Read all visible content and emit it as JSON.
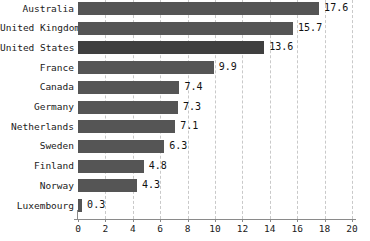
{
  "chart_data": {
    "type": "bar",
    "orientation": "horizontal",
    "title": "",
    "subtitle": "",
    "xlabel": "",
    "ylabel": "",
    "xlim": [
      0,
      20
    ],
    "xticks": [
      0,
      2,
      4,
      6,
      8,
      10,
      12,
      14,
      16,
      18,
      20
    ],
    "xtick_labels": [
      "0",
      "2",
      "4",
      "6",
      "8",
      "10",
      "12",
      "14",
      "16",
      "18",
      "20"
    ],
    "grid": "vertical-dashed",
    "legend": "none",
    "categories": [
      "Australia",
      "United Kingdom",
      "United States",
      "France",
      "Canada",
      "Germany",
      "Netherlands",
      "Sweden",
      "Finland",
      "Norway",
      "Luxembourg"
    ],
    "values": [
      17.6,
      15.7,
      13.6,
      9.9,
      7.4,
      7.3,
      7.1,
      6.3,
      4.8,
      4.3,
      0.3
    ],
    "value_labels": [
      "17.6",
      "15.7",
      "13.6",
      "9.9",
      "7.4",
      "7.3",
      "7.1",
      "6.3",
      "4.8",
      "4.3",
      "0.3"
    ],
    "bar_color": "#555555",
    "highlight_bar_color": "#3f3f3f",
    "highlight_category": "United States",
    "grid_color": "#c9c9c9",
    "axis_color": "#8a8a8a",
    "text_color": "#1a1a1a"
  }
}
